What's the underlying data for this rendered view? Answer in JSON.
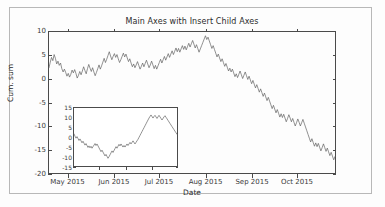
{
  "figure": {
    "width": 385,
    "height": 207,
    "background_color": "#fdfdfd",
    "border_color": "#b8b8b8",
    "line_color": "#5f5f5f",
    "axis_color": "#4a4a4a",
    "text_color": "#2b2b2b"
  },
  "chart_data": [
    {
      "id": "main_axes",
      "type": "line",
      "title": "Main Axes with Insert Child Axes",
      "xlabel": "Date",
      "ylabel": "Cum. sum",
      "grid": false,
      "legend": null,
      "ylim": [
        -20,
        10
      ],
      "yticks": [
        10,
        5,
        0,
        -5,
        -10,
        -15,
        -20
      ],
      "ytick_labels": [
        "10",
        "5",
        "0",
        "-5",
        "-10",
        "-15",
        "-20"
      ],
      "xlim": [
        "2015-04-18",
        "2015-10-27"
      ],
      "xticks": [
        "2015-05-01",
        "2015-06-01",
        "2015-07-01",
        "2015-08-01",
        "2015-09-01",
        "2015-10-01"
      ],
      "xtick_labels": [
        "May 2015",
        "Jun 2015",
        "Jul 2015",
        "Aug 2015",
        "Sep 2015",
        "Oct 2015"
      ],
      "series": [
        {
          "name": "Cum. sum",
          "color": "#5f5f5f",
          "linewidth": 0.7,
          "values": [
            2.4,
            3.6,
            4.6,
            3.9,
            5.2,
            4.4,
            3.2,
            3.8,
            2.9,
            3.4,
            2.2,
            1.5,
            2.1,
            1.4,
            0.6,
            1.2,
            0.4,
            1.0,
            1.9,
            1.3,
            2.0,
            1.2,
            0.2,
            0.8,
            1.6,
            0.9,
            1.7,
            2.6,
            1.8,
            1.1,
            2.2,
            3.1,
            2.3,
            1.6,
            2.4,
            1.5,
            0.7,
            1.4,
            2.2,
            3.0,
            2.1,
            2.8,
            3.6,
            4.4,
            3.5,
            4.2,
            5.0,
            5.8,
            4.9,
            4.1,
            4.8,
            5.4,
            4.6,
            5.2,
            4.3,
            3.5,
            4.1,
            4.8,
            5.5,
            4.7,
            5.3,
            4.5,
            3.7,
            4.3,
            3.4,
            2.6,
            3.2,
            2.4,
            3.0,
            3.7,
            2.9,
            2.1,
            2.7,
            3.4,
            2.6,
            3.3,
            4.0,
            3.2,
            2.4,
            3.0,
            3.8,
            3.0,
            2.2,
            2.9,
            2.1,
            2.8,
            3.5,
            4.2,
            3.4,
            4.1,
            4.8,
            4.0,
            4.7,
            5.4,
            4.6,
            5.3,
            6.0,
            5.2,
            5.9,
            6.6,
            5.8,
            6.5,
            5.7,
            6.4,
            7.1,
            6.3,
            7.0,
            6.2,
            6.9,
            7.6,
            6.8,
            7.5,
            8.2,
            7.4,
            6.6,
            7.3,
            6.5,
            5.7,
            6.4,
            7.1,
            7.8,
            8.5,
            9.2,
            8.4,
            8.9,
            8.1,
            7.3,
            6.5,
            7.1,
            6.3,
            5.5,
            4.7,
            5.3,
            4.5,
            3.7,
            4.3,
            3.5,
            2.7,
            3.3,
            2.5,
            1.7,
            2.3,
            1.5,
            2.1,
            1.3,
            0.5,
            1.1,
            0.3,
            1.0,
            1.7,
            0.9,
            0.1,
            0.8,
            1.5,
            0.7,
            -0.1,
            0.6,
            -0.2,
            -1.0,
            -0.3,
            -1.1,
            -1.9,
            -1.2,
            -2.0,
            -2.8,
            -2.1,
            -2.9,
            -3.7,
            -3.0,
            -3.8,
            -4.6,
            -3.9,
            -4.7,
            -5.5,
            -6.3,
            -5.6,
            -6.4,
            -7.2,
            -6.5,
            -7.3,
            -8.1,
            -7.4,
            -8.2,
            -7.5,
            -8.3,
            -9.1,
            -8.4,
            -7.6,
            -8.3,
            -9.1,
            -8.4,
            -9.2,
            -10.0,
            -9.3,
            -8.5,
            -9.2,
            -10.0,
            -9.3,
            -8.6,
            -9.4,
            -10.2,
            -11.0,
            -11.8,
            -12.6,
            -13.4,
            -12.7,
            -13.5,
            -14.3,
            -13.6,
            -14.4,
            -13.7,
            -14.5,
            -15.3,
            -14.6,
            -13.8,
            -14.6,
            -15.4,
            -14.7,
            -15.5,
            -16.3,
            -15.6,
            -16.4,
            -17.2,
            -16.5
          ]
        }
      ]
    },
    {
      "id": "inset_child_axes",
      "type": "line",
      "title": "",
      "xlabel": "",
      "ylabel": "",
      "grid": false,
      "legend": null,
      "ylim": [
        -15,
        15
      ],
      "yticks": [
        15,
        10,
        5,
        0,
        -5,
        -10,
        -15
      ],
      "ytick_labels": [
        "15",
        "10",
        "5",
        "0",
        "-5",
        "-10",
        "-15"
      ],
      "xticks": [
        0.25,
        0.5,
        0.75
      ],
      "xtick_labels": [
        "",
        "",
        ""
      ],
      "series": [
        {
          "name": "Cum. sum (inset)",
          "color": "#5f5f5f",
          "linewidth": 0.7,
          "values": [
            1.6,
            0.4,
            -0.6,
            0.2,
            -0.8,
            -1.8,
            -1.0,
            -2.0,
            -3.0,
            -2.2,
            -3.2,
            -4.2,
            -3.4,
            -4.4,
            -5.4,
            -4.6,
            -5.6,
            -4.8,
            -5.8,
            -5.0,
            -4.2,
            -3.4,
            -4.4,
            -3.6,
            -4.6,
            -5.6,
            -6.6,
            -7.6,
            -6.8,
            -7.8,
            -8.8,
            -9.8,
            -9.0,
            -10.0,
            -11.0,
            -10.2,
            -9.2,
            -8.2,
            -7.2,
            -8.0,
            -7.0,
            -6.0,
            -5.0,
            -5.8,
            -4.8,
            -3.8,
            -4.6,
            -3.6,
            -4.4,
            -5.2,
            -4.4,
            -5.2,
            -4.4,
            -3.6,
            -4.4,
            -3.6,
            -2.8,
            -3.6,
            -2.8,
            -2.0,
            -2.8,
            -3.6,
            -2.8,
            -2.0,
            -1.2,
            -0.2,
            0.8,
            1.8,
            2.8,
            3.8,
            4.8,
            5.8,
            6.8,
            7.8,
            8.8,
            9.8,
            10.6,
            11.4,
            10.6,
            9.8,
            10.6,
            11.2,
            10.4,
            9.6,
            10.4,
            11.2,
            10.4,
            9.6,
            8.8,
            9.6,
            10.4,
            11.0,
            10.2,
            9.4,
            8.6,
            7.8,
            7.0,
            6.2,
            5.4,
            4.6,
            3.8,
            3.0,
            2.2,
            1.4
          ]
        }
      ]
    }
  ]
}
